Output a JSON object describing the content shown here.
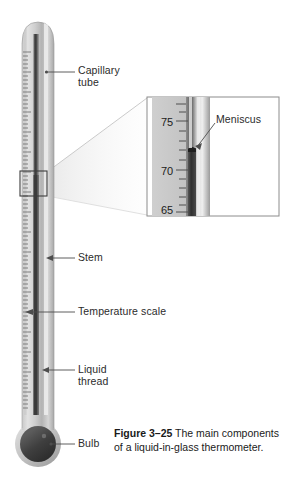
{
  "figure": {
    "number": "Figure 3–25",
    "caption_text": " The main components of a liquid-in-glass thermometer."
  },
  "labels": {
    "capillary_tube": "Capillary\ntube",
    "stem": "Stem",
    "temperature_scale": "Temperature scale",
    "liquid_thread": "Liquid\nthread",
    "bulb": "Bulb",
    "meniscus": "Meniscus"
  },
  "inset": {
    "scale_numbers": [
      "75",
      "70",
      "65"
    ],
    "meniscus_reading": "71",
    "callout_label": "Meniscus"
  },
  "colors": {
    "background": "#ffffff",
    "glass_light": "#d9d9d9",
    "glass_mid": "#bcbcbc",
    "glass_dark": "#8f8f8f",
    "liquid_column": "#4a4a4a",
    "bulb_fill": "#3a3a3a",
    "tick_mark": "#6a6a6a",
    "text": "#231f20",
    "leader_line": "#4d4d4d"
  }
}
